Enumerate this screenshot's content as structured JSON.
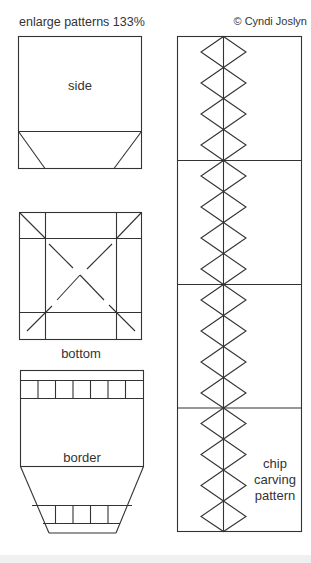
{
  "header": {
    "instruction": "enlarge patterns 133%",
    "copyright": "© Cyndi Joslyn"
  },
  "patterns": {
    "side": {
      "label": "side"
    },
    "bottom": {
      "label": "bottom"
    },
    "border": {
      "label": "border"
    },
    "chip": {
      "label_lines": [
        "chip",
        "carving",
        "pattern"
      ]
    }
  },
  "colors": {
    "line": "#333333",
    "background": "#ffffff"
  }
}
